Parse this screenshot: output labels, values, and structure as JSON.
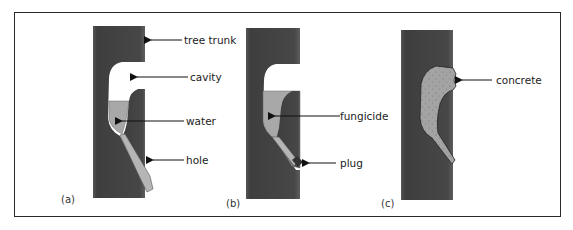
{
  "figure": {
    "panels": [
      {
        "id": "a",
        "label": "(a)",
        "annotations": [
          "tree trunk",
          "cavity",
          "water",
          "hole"
        ]
      },
      {
        "id": "b",
        "label": "(b)",
        "annotations": [
          "fungicide",
          "plug"
        ]
      },
      {
        "id": "c",
        "label": "(c)",
        "annotations": [
          "concrete"
        ]
      }
    ]
  },
  "colors": {
    "trunk": "#4a4a4a",
    "cavity": "#ffffff",
    "liquid": "#a8a8a8",
    "concrete": "#9e9e9e",
    "plug": "#3a3a3a",
    "frame": "#2a2a2a"
  }
}
